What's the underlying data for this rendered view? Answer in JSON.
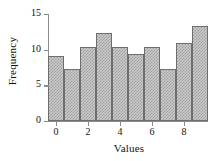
{
  "chart_data": {
    "type": "bar",
    "title": "",
    "xlabel": "Values",
    "ylabel": "Frequency",
    "categories": [
      "-0.5",
      "0.5",
      "1.5",
      "2.5",
      "3.5",
      "4.5",
      "5.5",
      "6.5",
      "7.5",
      "8.5"
    ],
    "bin_edges": [
      -0.5,
      0.5,
      1.5,
      2.5,
      3.5,
      4.5,
      5.5,
      6.5,
      7.5,
      8.5,
      9.5
    ],
    "bin_centers": [
      0,
      1,
      2,
      3,
      4,
      5,
      6,
      7,
      8,
      9
    ],
    "values": [
      9.1,
      7.3,
      10.4,
      12.3,
      10.4,
      9.4,
      10.4,
      7.3,
      11.0,
      13.3
    ],
    "xlim": [
      -0.5,
      9.5
    ],
    "ylim": [
      0,
      15
    ],
    "xticks": [
      0,
      2,
      4,
      6,
      8
    ],
    "xtick_labels": [
      "0",
      "2",
      "4",
      "6",
      "8"
    ],
    "yticks": [
      0,
      5,
      10,
      15
    ],
    "ytick_labels": [
      "0",
      "5",
      "10",
      "15"
    ],
    "grid": false,
    "legend": false,
    "bar_face_color": "#cbcbcb",
    "bar_hatch_color": "#9d9d9d",
    "bar_edge_color": "#6e6e6e",
    "axis_color": "#8a8a8a",
    "background_color": "#ffffff"
  }
}
